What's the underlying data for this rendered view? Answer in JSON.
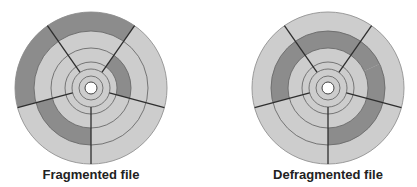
{
  "colors": {
    "light": "#cdcdcd",
    "dark": "#8c8c8c",
    "track_line": "#6a6a6a",
    "spoke": "#2e2e2e",
    "hole": "#ffffff"
  },
  "geometry": {
    "hole_r": 6,
    "track_radii": [
      12,
      19,
      26,
      40,
      57,
      76
    ],
    "spoke_angles_deg": [
      -35,
      35,
      105,
      180,
      255
    ]
  },
  "discs": [
    {
      "caption": "Fragmented file",
      "cx": 91,
      "cy": 88,
      "dark_segments": [
        {
          "track": 4,
          "from": 255,
          "to": 395
        },
        {
          "track": 2,
          "from": 35,
          "to": 105
        },
        {
          "track": 3,
          "from": 180,
          "to": 255
        }
      ]
    },
    {
      "caption": "Defragmented file",
      "cx": 328,
      "cy": 88,
      "dark_segments": [
        {
          "track": 3,
          "from": 255,
          "to": 540
        }
      ]
    }
  ]
}
